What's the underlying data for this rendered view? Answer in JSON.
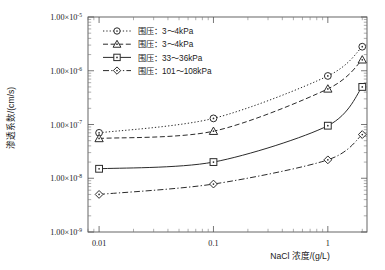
{
  "chart_data": {
    "type": "line",
    "title": "",
    "xlabel": "NaCl 浓度/(g/L)",
    "ylabel": "渗透系数/(cm/s)",
    "xscale": "log",
    "yscale": "log",
    "xlim": [
      0.008,
      2.2
    ],
    "ylim": [
      1e-09,
      1e-05
    ],
    "grid": false,
    "legend_position": "top-left",
    "xticks": [
      0.01,
      0.1,
      1
    ],
    "xtick_labels": [
      "0.01",
      "0.1",
      "1"
    ],
    "yticks": [
      1e-09,
      1e-08,
      1e-07,
      1e-06,
      1e-05
    ],
    "ytick_labels": [
      {
        "mantissa": "1.00",
        "times": "×",
        "base": "10",
        "exp": "-9"
      },
      {
        "mantissa": "1.00",
        "times": "×",
        "base": "10",
        "exp": "-8"
      },
      {
        "mantissa": "1.00",
        "times": "×",
        "base": "10",
        "exp": "-7"
      },
      {
        "mantissa": "1.00",
        "times": "×",
        "base": "10",
        "exp": "-6"
      },
      {
        "mantissa": "1.00",
        "times": "×",
        "base": "10",
        "exp": "-5"
      }
    ],
    "x": [
      0.01,
      0.1,
      1,
      2
    ],
    "series": [
      {
        "name": "围压：3～4kPa",
        "marker": "circle",
        "dash": "dotted",
        "values": [
          7e-08,
          1.3e-07,
          8e-07,
          2.8e-06
        ]
      },
      {
        "name": "围压：3～4kPa",
        "marker": "triangle",
        "dash": "dashed",
        "values": [
          5.5e-08,
          7.5e-08,
          4.6e-07,
          1.6e-06
        ]
      },
      {
        "name": "围压：33～36kPa",
        "marker": "square",
        "dash": "solid",
        "values": [
          1.5e-08,
          2e-08,
          9.5e-08,
          5e-07
        ]
      },
      {
        "name": "围压：101～108kPa",
        "marker": "diamond",
        "dash": "dashdot",
        "values": [
          5e-09,
          7.8e-09,
          2.2e-08,
          6.5e-08
        ]
      }
    ]
  },
  "legend": {
    "entries": [
      {
        "label": "围压：3～4kPa"
      },
      {
        "label": "围压：3～4kPa"
      },
      {
        "label": "围压：33～36kPa"
      },
      {
        "label": "围压：101～108kPa"
      }
    ]
  },
  "axes": {
    "x_title": "NaCl 浓度/(g/L)",
    "y_title": "渗透系数/(cm/s)"
  },
  "colors": {
    "ink": "#2b2b2b",
    "frame": "#555555",
    "background": "#ffffff"
  }
}
